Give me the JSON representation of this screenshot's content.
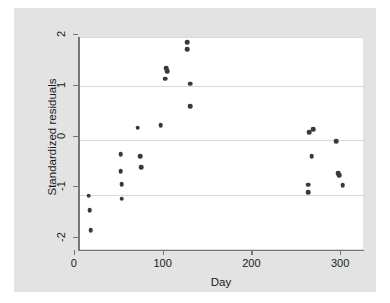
{
  "chart_data": {
    "type": "scatter",
    "title": "",
    "xlabel": "Day",
    "ylabel": "Standardized residuals",
    "xlim": [
      -10,
      310
    ],
    "ylim": [
      -2.1,
      2.1
    ],
    "xticks": [
      0,
      100,
      200,
      300
    ],
    "xtick_labels": [
      "0",
      "100",
      "200",
      "300"
    ],
    "yticks": [
      2,
      1,
      0,
      -1,
      -2
    ],
    "ytick_labels": [
      "2",
      "1",
      "0",
      "-1",
      "-2"
    ],
    "grid": "horizontal",
    "legend": "none",
    "marker_color": "#3a3a3a",
    "plot_background": "#ffffff",
    "figure_background": "#e3e3e3",
    "gridline_color": "#d9d9d9",
    "axis_color": "#777777",
    "points": [
      {
        "x": 0,
        "y": -1.03
      },
      {
        "x": 1,
        "y": -1.32
      },
      {
        "x": 2,
        "y": -1.71
      },
      {
        "x": 36,
        "y": -0.21
      },
      {
        "x": 36,
        "y": -0.55
      },
      {
        "x": 37,
        "y": -0.8
      },
      {
        "x": 37,
        "y": -1.09
      },
      {
        "x": 55,
        "y": 0.31
      },
      {
        "x": 58,
        "y": -0.25
      },
      {
        "x": 59,
        "y": -0.47
      },
      {
        "x": 81,
        "y": 0.36
      },
      {
        "x": 87,
        "y": 1.48
      },
      {
        "x": 88,
        "y": 1.42
      },
      {
        "x": 86,
        "y": 1.28
      },
      {
        "x": 111,
        "y": 2.0
      },
      {
        "x": 111,
        "y": 1.86
      },
      {
        "x": 114,
        "y": 1.18
      },
      {
        "x": 114,
        "y": 0.74
      },
      {
        "x": 248,
        "y": 0.22
      },
      {
        "x": 253,
        "y": 0.28
      },
      {
        "x": 247,
        "y": -0.81
      },
      {
        "x": 247,
        "y": -0.96
      },
      {
        "x": 251,
        "y": -0.25
      },
      {
        "x": 279,
        "y": 0.05
      },
      {
        "x": 281,
        "y": -0.58
      },
      {
        "x": 282,
        "y": -0.62
      },
      {
        "x": 286,
        "y": -0.82
      }
    ]
  }
}
